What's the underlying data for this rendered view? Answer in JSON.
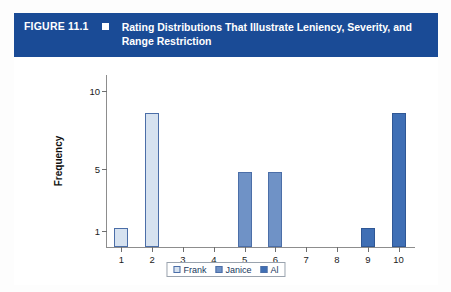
{
  "header": {
    "figure_number": "FIGURE 11.1",
    "bullet_icon": "filled-square-icon",
    "title": "Rating Distributions That Illustrate Leniency, Severity, and Range Restriction",
    "bar_color": "#1a4b96",
    "text_color": "#ffffff"
  },
  "chart_data": {
    "type": "bar",
    "title": "Rating Distributions That Illustrate Leniency, Severity, and Range Restriction",
    "xlabel": "",
    "ylabel": "Frequency",
    "x": [
      1,
      2,
      3,
      4,
      5,
      6,
      7,
      8,
      9,
      10
    ],
    "xtick_labels": [
      "1",
      "2",
      "3",
      "4",
      "5",
      "6",
      "7",
      "8",
      "9",
      "10"
    ],
    "ytick_labels": [
      "1",
      "5",
      "10"
    ],
    "ytick_values": [
      1,
      5,
      10
    ],
    "ylim": [
      0,
      11
    ],
    "xlim": [
      0.5,
      10.5
    ],
    "grid": false,
    "legend_position": "bottom-center",
    "series": [
      {
        "name": "Frank",
        "color": "#d6e2f0",
        "edge_color": "#4b6ea8",
        "values": [
          1.2,
          8.6,
          0,
          0,
          0,
          0,
          0,
          0,
          0,
          0
        ]
      },
      {
        "name": "Janice",
        "color": "#6f92c6",
        "edge_color": "#4b6ea8",
        "values": [
          0,
          0,
          0,
          0,
          4.8,
          4.8,
          0,
          0,
          0,
          0
        ]
      },
      {
        "name": "Al",
        "color": "#3f6fb5",
        "edge_color": "#2f5795",
        "values": [
          0,
          0,
          0,
          0,
          0,
          0,
          0,
          0,
          1.2,
          8.6
        ]
      }
    ]
  },
  "legend": {
    "items": [
      {
        "label": "Frank",
        "color": "#d6e2f0"
      },
      {
        "label": "Janice",
        "color": "#6f92c6"
      },
      {
        "label": "Al",
        "color": "#3f6fb5"
      }
    ]
  }
}
